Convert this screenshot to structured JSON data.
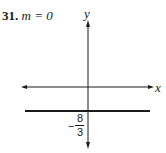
{
  "problem": {
    "number": "31.",
    "equation": "m = 0"
  },
  "axes": {
    "x_label": "x",
    "y_label": "y"
  },
  "line": {
    "description": "horizontal line y = -8/3",
    "intercept_sign": "−",
    "intercept_numerator": "8",
    "intercept_denominator": "3"
  },
  "colors": {
    "ink": "#1a1a1a",
    "background": "#ffffff"
  }
}
